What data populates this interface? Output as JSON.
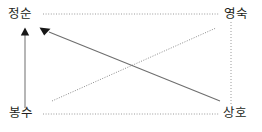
{
  "figure": {
    "type": "relationship-diagram",
    "background_color": "#ffffff",
    "line_color": "#6e6e6e",
    "dotted_color": "#8c8c8c",
    "arrow_color": "#1a1a1a",
    "text_color": "#231f20"
  },
  "nodes": [
    {
      "id": "top-left",
      "label": "정순",
      "x": 8,
      "y": 8
    },
    {
      "id": "top-right",
      "label": "영숙",
      "x": 224,
      "y": 8
    },
    {
      "id": "bottom-left",
      "label": "봉수",
      "x": 9,
      "y": 107
    },
    {
      "id": "bottom-right",
      "label": "상호",
      "x": 223,
      "y": 107
    }
  ],
  "edges": [
    {
      "id": "frame-top",
      "style": "dotted",
      "from": "top-left",
      "to": "top-right",
      "arrow": false,
      "x1": 43,
      "y1": 14,
      "x2": 219,
      "y2": 14
    },
    {
      "id": "frame-bottom",
      "style": "dotted",
      "from": "bottom-left",
      "to": "bottom-right",
      "arrow": false,
      "x1": 43,
      "y1": 114,
      "x2": 219,
      "y2": 114
    },
    {
      "id": "frame-right",
      "style": "dotted",
      "from": "top-right",
      "to": "bottom-right",
      "arrow": false,
      "x1": 231,
      "y1": 22,
      "x2": 231,
      "y2": 104
    },
    {
      "id": "left-vertical-arrow",
      "style": "solid",
      "from": "bottom-left",
      "to": "top-left",
      "arrow": true,
      "x1": 25,
      "y1": 108,
      "x2": 25,
      "y2": 31
    },
    {
      "id": "diagonal-solid-arrow",
      "style": "solid",
      "from": "bottom-right",
      "to": "top-left",
      "arrow": true,
      "x1": 220,
      "y1": 101,
      "x2": 46,
      "y2": 31
    },
    {
      "id": "diagonal-dotted",
      "style": "dotted",
      "from": "bottom-left",
      "to": "top-right",
      "arrow": false,
      "x1": 52,
      "y1": 101,
      "x2": 216,
      "y2": 28
    }
  ]
}
